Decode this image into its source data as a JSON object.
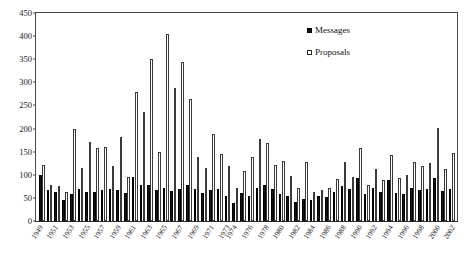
{
  "chart_data": {
    "type": "bar",
    "title": "",
    "subtitle": "",
    "xlabel": "",
    "ylabel": "",
    "ylim": [
      0,
      450
    ],
    "ytick_step": 50,
    "yticks": [
      0,
      50,
      100,
      150,
      200,
      250,
      300,
      350,
      400,
      450
    ],
    "grid": false,
    "legend_position": "top-right",
    "legend": [
      "Messages",
      "Proposals"
    ],
    "categories": [
      "1949",
      "1950",
      "1951",
      "1952",
      "1953",
      "1954",
      "1955",
      "1956",
      "1957",
      "1958",
      "1959",
      "1960",
      "1961",
      "1962",
      "1963",
      "1964",
      "1965",
      "1966",
      "1967",
      "1968",
      "1969",
      "1970",
      "1971",
      "1972",
      "1973",
      "1974",
      "1975",
      "1976",
      "1977",
      "1978",
      "1979",
      "1980",
      "1981",
      "1982",
      "1983",
      "1984",
      "1985",
      "1986",
      "1987",
      "1988",
      "1989",
      "1990",
      "1991",
      "1992",
      "1993",
      "1994",
      "1995",
      "1996",
      "1997",
      "1998",
      "1999",
      "2000",
      "2001",
      "2002"
    ],
    "tick_labels": [
      "1949",
      "",
      "1951",
      "",
      "1953",
      "",
      "1955",
      "",
      "1957",
      "",
      "1959",
      "",
      "1961",
      "",
      "1963",
      "",
      "1965",
      "",
      "1967",
      "",
      "1969",
      "",
      "1971",
      "",
      "1973",
      "1974",
      "",
      "1976",
      "",
      "1978",
      "",
      "1980",
      "",
      "1982",
      "",
      "1984",
      "",
      "1986",
      "",
      "1988",
      "",
      "1990",
      "",
      "1992",
      "",
      "1994",
      "",
      "1996",
      "",
      "1998",
      "",
      "2000",
      "",
      "2002"
    ],
    "series": [
      {
        "name": "Messages",
        "color": "#151515",
        "values": [
          100,
          68,
          62,
          45,
          58,
          70,
          62,
          62,
          68,
          70,
          68,
          60,
          95,
          78,
          78,
          68,
          72,
          65,
          70,
          78,
          70,
          60,
          68,
          70,
          55,
          38,
          60,
          55,
          72,
          78,
          70,
          58,
          55,
          42,
          48,
          45,
          55,
          52,
          62,
          75,
          70,
          92,
          58,
          72,
          62,
          88,
          60,
          58,
          72,
          68,
          70,
          92,
          65,
          70
        ]
      },
      {
        "name": "Proposals",
        "color": "#ffffff",
        "values": [
          122,
          78,
          75,
          62,
          198,
          115,
          172,
          158,
          160,
          120,
          182,
          95,
          280,
          235,
          350,
          150,
          405,
          288,
          345,
          265,
          138,
          115,
          188,
          145,
          118,
          72,
          108,
          138,
          178,
          168,
          122,
          130,
          98,
          72,
          128,
          62,
          68,
          72,
          90,
          128,
          95,
          158,
          78,
          112,
          88,
          142,
          92,
          100,
          128,
          120,
          125,
          202,
          112,
          148
        ]
      }
    ]
  },
  "legend": {
    "messages_label": "Messages",
    "proposals_label": "Proposals"
  }
}
